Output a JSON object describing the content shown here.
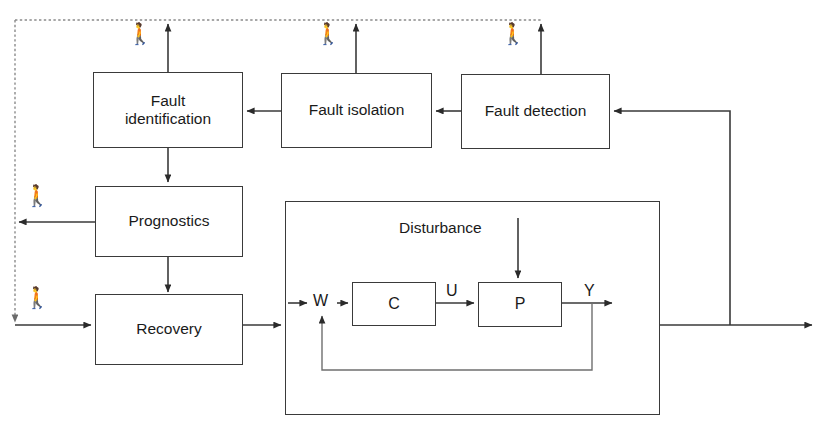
{
  "diagram": {
    "line_color": "#3a3a3a",
    "text_color": "#1a1a1a",
    "background": "#ffffff",
    "supervision_blocks": [
      {
        "id": "fault-identification",
        "label": "Fault\nidentification"
      },
      {
        "id": "fault-isolation",
        "label": "Fault isolation"
      },
      {
        "id": "fault-detection",
        "label": "Fault detection"
      },
      {
        "id": "prognostics",
        "label": "Prognostics"
      },
      {
        "id": "recovery",
        "label": "Recovery"
      }
    ],
    "labels": {
      "fault_identification_line1": "Fault",
      "fault_identification_line2": "identification",
      "fault_isolation": "Fault isolation",
      "fault_detection": "Fault detection",
      "prognostics": "Prognostics",
      "recovery": "Recovery",
      "disturbance": "Disturbance",
      "controller": "C",
      "plant": "P"
    },
    "signals": {
      "reference": "W",
      "control": "U",
      "output": "Y"
    },
    "operator_icons": [
      {
        "id": "operator-fault-identification",
        "glyph": "🚶"
      },
      {
        "id": "operator-fault-isolation",
        "glyph": "🚶"
      },
      {
        "id": "operator-fault-detection",
        "glyph": "🚶"
      },
      {
        "id": "operator-prognostics",
        "glyph": "🚶"
      },
      {
        "id": "operator-recovery",
        "glyph": "🚶"
      }
    ]
  }
}
